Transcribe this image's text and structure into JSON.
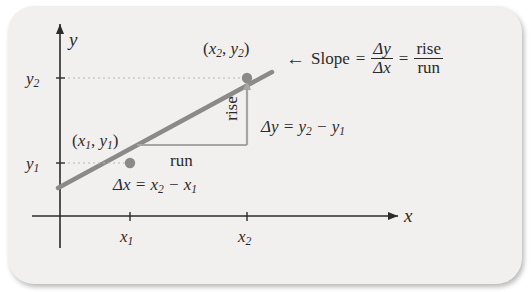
{
  "figure": {
    "type": "slope-definition-diagram",
    "background_color": "#f2f0ee",
    "line_color": "#8a8a8a",
    "axis_color": "#2b2b2b",
    "axes": {
      "x_axis_label": "x",
      "y_axis_label": "y"
    },
    "tick_labels": {
      "x1": "x",
      "x1_sub": "1",
      "x2": "x",
      "x2_sub": "2",
      "y1": "y",
      "y1_sub": "1",
      "y2": "y",
      "y2_sub": "2"
    },
    "points": [
      {
        "label_x": "x",
        "label_x_sub": "1",
        "label_y": "y",
        "label_y_sub": "1",
        "name": "point-1"
      },
      {
        "label_x": "x",
        "label_x_sub": "2",
        "label_y": "y",
        "label_y_sub": "2",
        "name": "point-2"
      }
    ],
    "annotations": {
      "rise_label": "rise",
      "run_label": "run",
      "delta_y_text": "Δy = y",
      "delta_y_sub1": "2",
      "delta_y_minus": " − y",
      "delta_y_sub2": "1",
      "delta_x_text": "Δx = x",
      "delta_x_sub1": "2",
      "delta_x_minus": " − x",
      "delta_x_sub2": "1",
      "slope_word": "Slope",
      "equals": "=",
      "frac1_num": "Δy",
      "frac1_den": "Δx",
      "frac2_num": "rise",
      "frac2_den": "run",
      "arrow": "←"
    }
  }
}
